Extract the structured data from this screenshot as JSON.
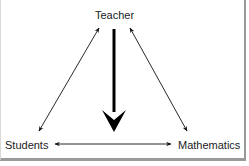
{
  "diagram": {
    "type": "didactic-triangle",
    "nodes": {
      "top": "Teacher",
      "bottom_left": "Students",
      "bottom_right": "Mathematics"
    },
    "edges": [
      {
        "from": "Teacher",
        "to": "Students",
        "style": "thin",
        "direction": "bidirectional"
      },
      {
        "from": "Teacher",
        "to": "Mathematics",
        "style": "thin",
        "direction": "bidirectional"
      },
      {
        "from": "Students",
        "to": "Mathematics",
        "style": "thin",
        "direction": "bidirectional"
      },
      {
        "from": "Teacher",
        "to": "Students-Mathematics edge",
        "style": "thick",
        "direction": "down"
      }
    ],
    "colors": {
      "stroke": "#111111",
      "text": "#222222",
      "background": "#ffffff",
      "frame": "#9a9a9a"
    }
  }
}
